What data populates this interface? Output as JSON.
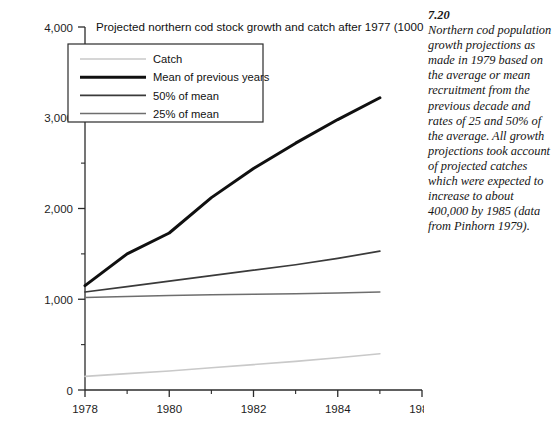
{
  "figure": {
    "title": "Projected northern cod stock growth and catch after 1977 (1000 t)",
    "caption_number": "7.20",
    "caption_text": "Northern cod population growth projections as made in 1979 based on the average or mean recruitment from the previous decade and rates of 25 and 50% of the average. All growth projections took account of projected catches which were expected to increase to about 400,000 by 1985 (data from Pinhorn 1979)."
  },
  "axes": {
    "y_tick_labels": [
      "4,000",
      "3,000",
      "2,000",
      "1,000",
      "0"
    ],
    "x_tick_labels": [
      "1978",
      "1980",
      "1982",
      "1984",
      "1986"
    ]
  },
  "legend": {
    "items": [
      {
        "label": "Catch",
        "color": "#c9c9c9",
        "width": 1.6
      },
      {
        "label": "Mean of previous years",
        "color": "#101010",
        "width": 3.0
      },
      {
        "label": "50% of mean",
        "color": "#3a3a3a",
        "width": 1.7
      },
      {
        "label": "25% of mean",
        "color": "#6e6e6e",
        "width": 1.5
      }
    ]
  },
  "chart_data": {
    "type": "line",
    "title": "Projected northern cod stock growth and catch after 1977 (1000 t)",
    "xlabel": "",
    "ylabel": "",
    "xlim": [
      1978,
      1986
    ],
    "ylim": [
      0,
      4000
    ],
    "yticks": [
      0,
      1000,
      2000,
      3000,
      4000
    ],
    "yticks_minor": [
      500,
      1500,
      2500,
      3500
    ],
    "xticks": [
      1978,
      1980,
      1982,
      1984,
      1986
    ],
    "xticks_minor": [
      1979,
      1981,
      1983,
      1985
    ],
    "grid": false,
    "legend_position": "upper left inside",
    "x": [
      1978,
      1979,
      1980,
      1981,
      1982,
      1983,
      1984,
      1985
    ],
    "series": [
      {
        "name": "Mean of previous years",
        "color": "#101010",
        "linewidth": 3.0,
        "values": [
          1150,
          1500,
          1730,
          2120,
          2440,
          2720,
          2980,
          3220
        ]
      },
      {
        "name": "50% of mean",
        "color": "#3a3a3a",
        "linewidth": 1.7,
        "values": [
          1080,
          1140,
          1200,
          1260,
          1320,
          1380,
          1450,
          1530
        ]
      },
      {
        "name": "25% of mean",
        "color": "#6e6e6e",
        "linewidth": 1.5,
        "values": [
          1020,
          1030,
          1040,
          1050,
          1055,
          1060,
          1070,
          1080
        ]
      },
      {
        "name": "Catch",
        "color": "#c9c9c9",
        "linewidth": 1.6,
        "values": [
          150,
          180,
          210,
          245,
          280,
          315,
          355,
          400
        ]
      }
    ]
  }
}
